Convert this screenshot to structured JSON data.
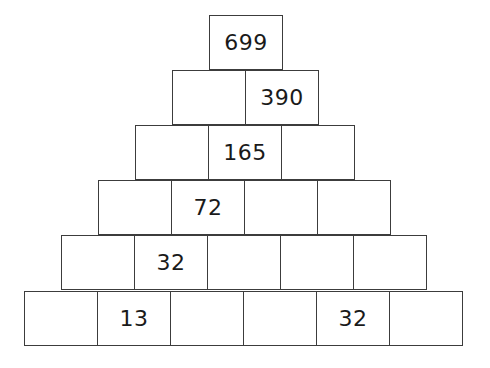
{
  "figure": {
    "kind": "number-pyramid-puzzle",
    "title": "",
    "background_color": "#ffffff",
    "line_color": "#3c3c3c",
    "text_color": "#1a1a1a",
    "cell_width_px": 74,
    "cell_height_px": 55,
    "row_count": 6
  },
  "chart_data": {
    "type": "table",
    "title": "",
    "xlabel": "",
    "ylabel": "",
    "rows": [
      {
        "index": 1,
        "cell_count": 1,
        "values": [
          "699"
        ]
      },
      {
        "index": 2,
        "cell_count": 2,
        "values": [
          "",
          "390"
        ]
      },
      {
        "index": 3,
        "cell_count": 3,
        "values": [
          "",
          "165",
          ""
        ]
      },
      {
        "index": 4,
        "cell_count": 4,
        "values": [
          "",
          "72",
          "",
          ""
        ]
      },
      {
        "index": 5,
        "cell_count": 5,
        "values": [
          "",
          "32",
          "",
          "",
          ""
        ]
      },
      {
        "index": 6,
        "cell_count": 6,
        "values": [
          "",
          "13",
          "",
          "",
          "32",
          ""
        ]
      }
    ]
  }
}
